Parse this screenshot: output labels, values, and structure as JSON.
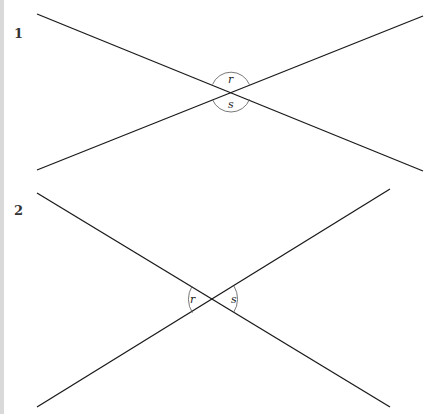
{
  "figures": [
    {
      "number": "1",
      "lines": [
        {
          "x1": 37,
          "y1": 14,
          "x2": 423,
          "y2": 171
        },
        {
          "x1": 37,
          "y1": 170,
          "x2": 423,
          "y2": 16
        }
      ],
      "intersection": {
        "x": 231,
        "y": 92
      },
      "angle_labels": [
        "r",
        "s"
      ],
      "arc_orientation": "vertical"
    },
    {
      "number": "2",
      "lines": [
        {
          "x1": 37,
          "y1": 193,
          "x2": 390,
          "y2": 407
        },
        {
          "x1": 37,
          "y1": 407,
          "x2": 390,
          "y2": 189
        }
      ],
      "intersection": {
        "x": 213,
        "y": 299
      },
      "angle_labels": [
        "r",
        "s"
      ],
      "arc_orientation": "horizontal"
    }
  ],
  "colors": {
    "line": "#1a1a1a",
    "arc": "#555555",
    "sidebar": "#d9d9d9"
  }
}
